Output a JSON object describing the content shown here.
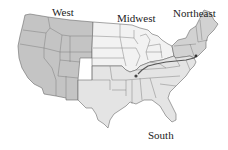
{
  "map": {
    "title": "United States census regions",
    "regions": [
      {
        "id": "west",
        "label": "West",
        "fill": "#c4c4c4"
      },
      {
        "id": "midwest",
        "label": "Midwest",
        "fill": "#f2f2f2"
      },
      {
        "id": "northeast",
        "label": "Northeast",
        "fill": "#d2d2d2"
      },
      {
        "id": "south",
        "label": "South",
        "fill": "#e4e4e4"
      }
    ],
    "route": {
      "color": "#555555",
      "points": [
        "St. Louis area",
        "New York City area"
      ]
    }
  },
  "labels": {
    "west": "West",
    "midwest": "Midwest",
    "northeast": "Northeast",
    "south": "South"
  }
}
